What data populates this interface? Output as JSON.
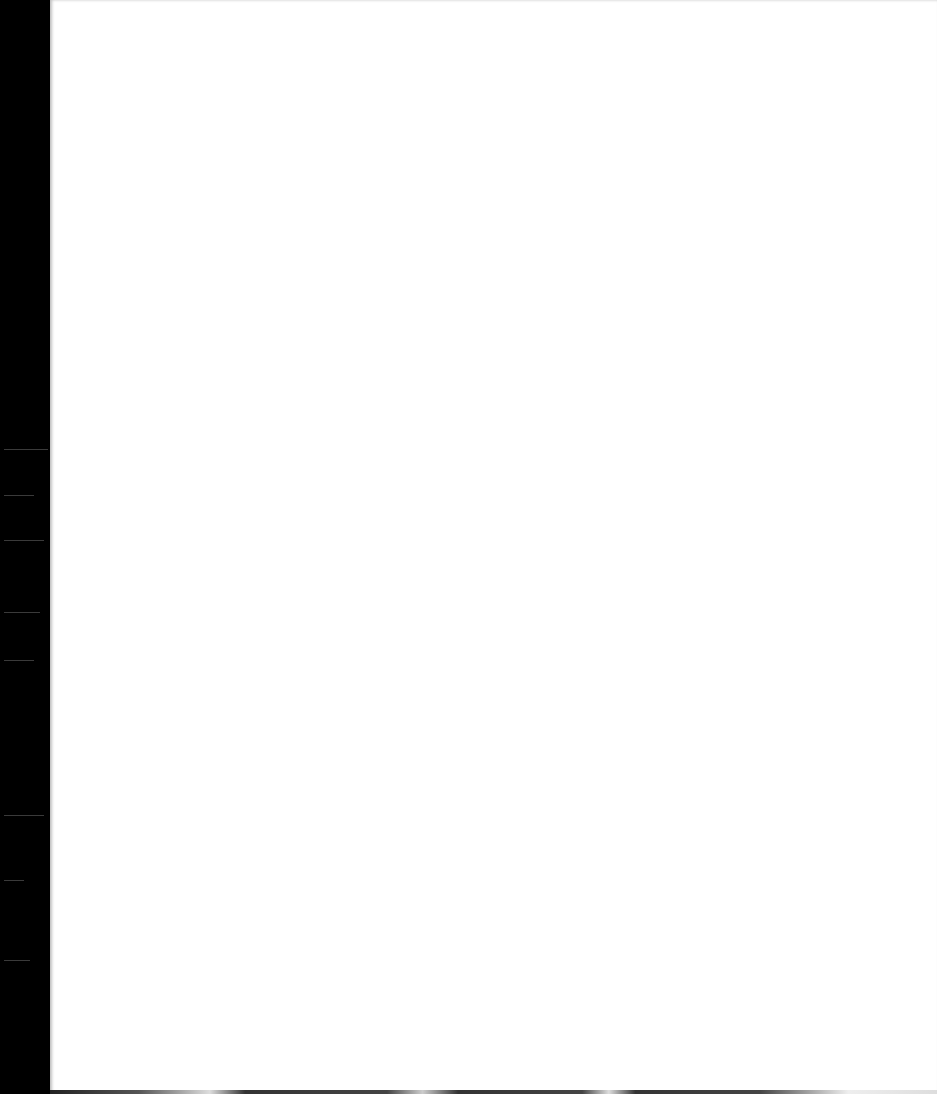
{
  "document": {
    "type": "scanned-page",
    "content": "",
    "colors": {
      "page": "#ffffff",
      "scan_edge": "#000000"
    }
  }
}
